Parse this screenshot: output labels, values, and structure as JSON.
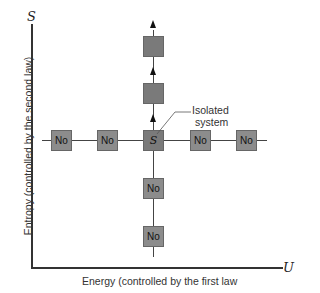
{
  "axes": {
    "y_symbol": "S",
    "y_label": "Entropy (controlled by the second law)",
    "x_symbol": "U",
    "x_label": "Energy (controlled by the first law"
  },
  "center_box": {
    "label": "S"
  },
  "horizontal_boxes": [
    {
      "label": "No"
    },
    {
      "label": "No"
    },
    {
      "label": "No"
    },
    {
      "label": "No"
    }
  ],
  "vertical_boxes_below": [
    {
      "label": "No"
    },
    {
      "label": "No"
    }
  ],
  "vertical_boxes_above": [
    {
      "label": ""
    },
    {
      "label": ""
    }
  ],
  "annotation": {
    "line1": "Isolated",
    "line2": "system"
  }
}
